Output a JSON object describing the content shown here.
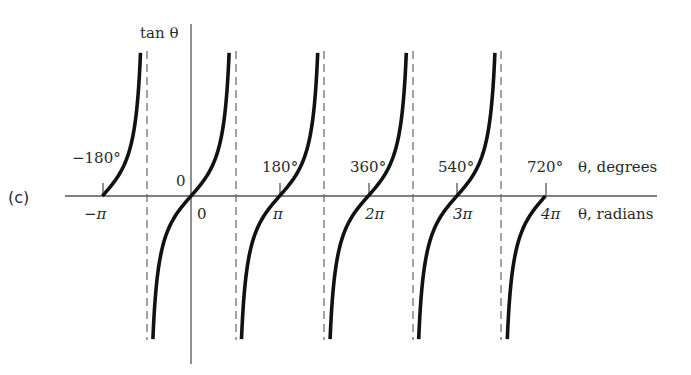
{
  "panel_label": "(c)",
  "axes": {
    "y_label": "tan θ",
    "x_label_degrees": "θ, degrees",
    "x_label_radians": "θ, radians",
    "origin_label_above": "0",
    "origin_label_below": "0"
  },
  "degree_ticks": [
    "−180°",
    "180°",
    "360°",
    "540°",
    "720°"
  ],
  "radian_ticks": [
    "−π",
    "π",
    "2π",
    "3π",
    "4π"
  ],
  "colors": {
    "curve": "#111111",
    "axis": "#555555",
    "asymptote": "#666666",
    "text": "#2a2a2a"
  },
  "chart_data": {
    "type": "line",
    "title": "",
    "function": "tan θ",
    "xlabel": "θ, radians / θ, degrees",
    "ylabel": "tan θ",
    "x_range_radians": [
      -3.14159,
      12.56637
    ],
    "x_ticks_radians": [
      "−π",
      "0",
      "π",
      "2π",
      "3π",
      "4π"
    ],
    "x_ticks_degrees": [
      "−180°",
      "0",
      "180°",
      "360°",
      "540°",
      "720°"
    ],
    "asymptotes_radians": [
      "−π/2",
      "π/2",
      "3π/2",
      "5π/2",
      "7π/2"
    ],
    "branches": [
      {
        "from": "−π",
        "to": "−π/2 (→ +∞)"
      },
      {
        "from": "−π/2 (−∞)",
        "to": "π/2 (+∞)"
      },
      {
        "from": "π/2 (−∞)",
        "to": "3π/2 (+∞)"
      },
      {
        "from": "3π/2 (−∞)",
        "to": "5π/2 (+∞)"
      },
      {
        "from": "5π/2 (−∞)",
        "to": "7π/2 (+∞)"
      },
      {
        "from": "7π/2 (−∞)",
        "to": "4π"
      }
    ],
    "zeros_radians": [
      "−π",
      "0",
      "π",
      "2π",
      "3π",
      "4π"
    ],
    "grid": false,
    "legend": null
  }
}
